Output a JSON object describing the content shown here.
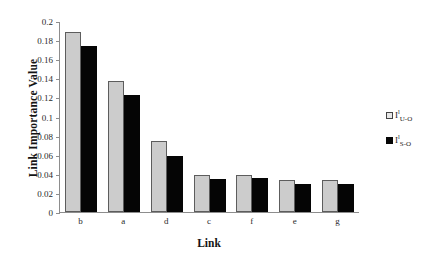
{
  "chart_data": {
    "type": "bar",
    "title": "",
    "xlabel": "Link",
    "ylabel": "Link Importance Value",
    "categories": [
      "b",
      "a",
      "d",
      "c",
      "f",
      "e",
      "g"
    ],
    "ylim": [
      0,
      0.2
    ],
    "yticks": [
      "0",
      "0.02",
      "0.04",
      "0.06",
      "0.08",
      "0.1",
      "0.12",
      "0.14",
      "0.16",
      "0.18",
      "0.2"
    ],
    "ytick_values": [
      0,
      0.02,
      0.04,
      0.06,
      0.08,
      0.1,
      0.12,
      0.14,
      0.16,
      0.18,
      0.2
    ],
    "grid": false,
    "legend_position": "right",
    "series": [
      {
        "name": "I^l_U-O",
        "base": "I",
        "superscript": "l",
        "subscript": "U-O",
        "color": "#cccccc",
        "values": [
          0.189,
          0.137,
          0.074,
          0.039,
          0.039,
          0.034,
          0.034
        ]
      },
      {
        "name": "I^l_S-O",
        "base": "I",
        "superscript": "l",
        "subscript": "S-O",
        "color": "#050505",
        "values": [
          0.174,
          0.123,
          0.059,
          0.035,
          0.036,
          0.029,
          0.029
        ]
      }
    ]
  }
}
